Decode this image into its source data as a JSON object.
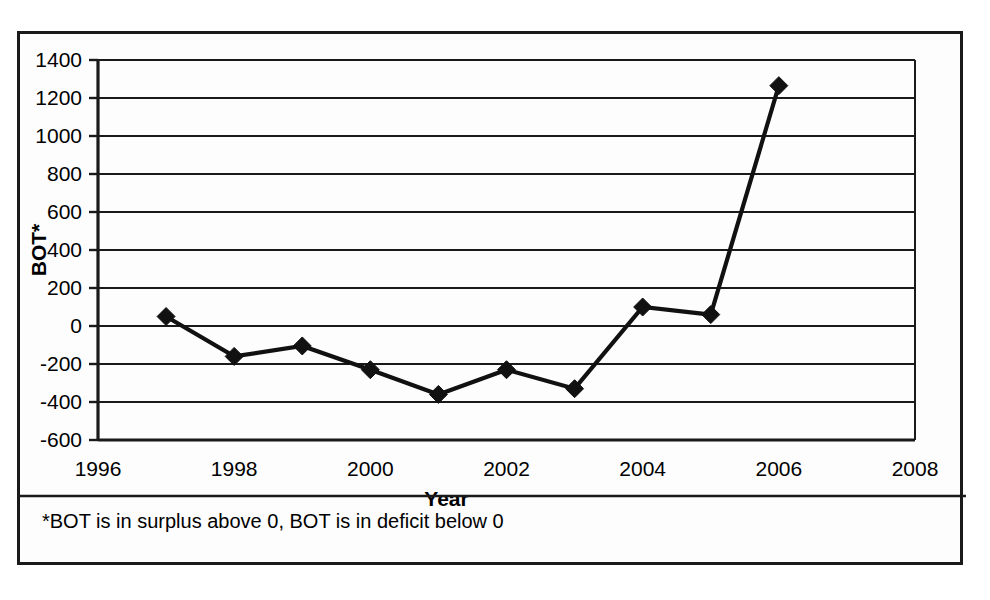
{
  "chart_data": {
    "type": "line",
    "title": "",
    "xlabel": "Year",
    "ylabel": "BOT*",
    "x": [
      1997,
      1998,
      1999,
      2000,
      2001,
      2002,
      2003,
      2004,
      2005,
      2006
    ],
    "values": [
      50,
      -160,
      -105,
      -230,
      -360,
      -230,
      -330,
      100,
      60,
      1265
    ],
    "series": [
      {
        "name": "BOT",
        "values": [
          50,
          -160,
          -105,
          -230,
          -360,
          -230,
          -330,
          100,
          60,
          1265
        ]
      }
    ],
    "xlim": [
      1996,
      2008
    ],
    "ylim": [
      -600,
      1400
    ],
    "xticks": [
      1996,
      1998,
      2000,
      2002,
      2004,
      2006,
      2008
    ],
    "xtick_labels": [
      "1996",
      "1998",
      "2000",
      "2002",
      "2004",
      "2006",
      "2008"
    ],
    "yticks": [
      -600,
      -400,
      -200,
      0,
      200,
      400,
      600,
      800,
      1000,
      1200,
      1400
    ],
    "ytick_labels": [
      "-600",
      "-400",
      "-200",
      "0",
      "200",
      "400",
      "600",
      "800",
      "1000",
      "1200",
      "1400"
    ],
    "grid": "horizontal",
    "legend": "none",
    "marker": "diamond",
    "line_color": "#111111",
    "marker_color": "#111111",
    "footnote": "*BOT is in surplus above 0, BOT is in deficit below 0"
  },
  "figure": {
    "y_axis_title": "BOT*",
    "x_axis_title": "Year",
    "footnote": "*BOT is in surplus above 0, BOT is in deficit below 0"
  }
}
